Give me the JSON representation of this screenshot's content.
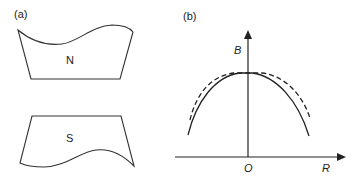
{
  "panel_a": {
    "label": "(a)",
    "north_pole_label": "N",
    "south_pole_label": "S"
  },
  "panel_b": {
    "label": "(b)",
    "y_axis_label": "B",
    "x_axis_label": "R",
    "origin_label": "O",
    "curves": [
      {
        "name": "solid-field-profile",
        "style": "solid"
      },
      {
        "name": "dashed-field-profile",
        "style": "dashed"
      }
    ]
  }
}
